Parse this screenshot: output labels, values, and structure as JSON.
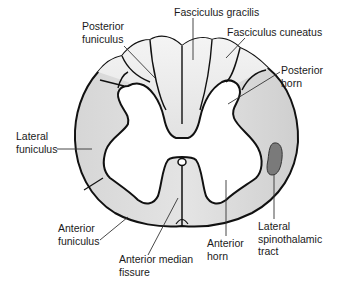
{
  "diagram": {
    "colors": {
      "white_matter_light": "#ececec",
      "white_matter_mid": "#d9d9d9",
      "gray_matter": "#ffffff",
      "tract_highlight": "#7a7a7a",
      "outline": "#111111",
      "leader_line": "#333333"
    },
    "labels": {
      "posterior_funiculus": {
        "line1": "Posterior",
        "line2": "funiculus"
      },
      "fasciculus_gracilis": {
        "line1": "Fasciculus gracilis"
      },
      "fasciculus_cuneatus": {
        "line1": "Fasciculus cuneatus"
      },
      "posterior_horn": {
        "line1": "Posterior",
        "line2": "horn"
      },
      "lateral_funiculus": {
        "line1": "Lateral",
        "line2": "funiculus"
      },
      "anterior_funiculus": {
        "line1": "Anterior",
        "line2": "funiculus"
      },
      "anterior_median_fissure": {
        "line1": "Anterior median",
        "line2": "fissure"
      },
      "anterior_horn": {
        "line1": "Anterior",
        "line2": "horn"
      },
      "lateral_spinothalamic_tract": {
        "line1": "Lateral",
        "line2": "spinothalamic",
        "line3": "tract"
      }
    }
  }
}
